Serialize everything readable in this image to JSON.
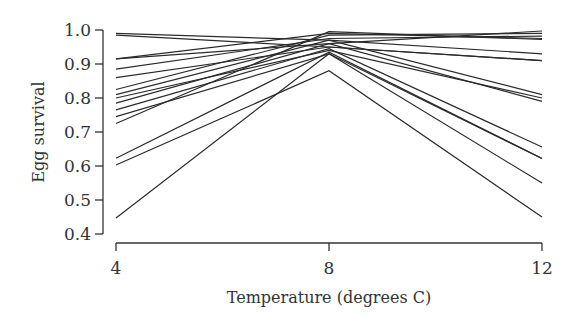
{
  "chart_data": {
    "type": "line",
    "title": "",
    "xlabel": "Temperature (degrees C)",
    "ylabel": "Egg survival",
    "x": [
      4,
      8,
      12
    ],
    "x_ticks": [
      "4",
      "8",
      "12"
    ],
    "y_ticks": [
      "0.4",
      "0.5",
      "0.6",
      "0.7",
      "0.8",
      "0.9",
      "1.0"
    ],
    "xlim": [
      4,
      12
    ],
    "ylim": [
      0.4,
      1.0
    ],
    "grid": false,
    "legend": "none",
    "line_color": "#2b2b2b",
    "series": [
      {
        "name": "family-1",
        "values": [
          0.99,
          0.97,
          0.93
        ]
      },
      {
        "name": "family-2",
        "values": [
          0.985,
          0.95,
          0.91
        ]
      },
      {
        "name": "family-3",
        "values": [
          0.915,
          0.99,
          0.975
        ]
      },
      {
        "name": "family-4",
        "values": [
          0.915,
          0.96,
          0.997
        ]
      },
      {
        "name": "family-5",
        "values": [
          0.885,
          0.975,
          0.982
        ]
      },
      {
        "name": "family-6",
        "values": [
          0.86,
          0.95,
          0.91
        ]
      },
      {
        "name": "family-7",
        "values": [
          0.825,
          0.985,
          0.99
        ]
      },
      {
        "name": "family-8",
        "values": [
          0.81,
          0.97,
          0.81
        ]
      },
      {
        "name": "family-9",
        "values": [
          0.8,
          0.94,
          0.8
        ]
      },
      {
        "name": "family-10",
        "values": [
          0.785,
          0.96,
          0.79
        ]
      },
      {
        "name": "family-11",
        "values": [
          0.765,
          0.945,
          0.656
        ]
      },
      {
        "name": "family-12",
        "values": [
          0.745,
          0.93,
          0.622
        ]
      },
      {
        "name": "family-13",
        "values": [
          0.725,
          0.995,
          0.972
        ]
      },
      {
        "name": "family-14",
        "values": [
          0.623,
          0.935,
          0.622
        ]
      },
      {
        "name": "family-15",
        "values": [
          0.603,
          0.88,
          0.45
        ]
      },
      {
        "name": "family-16",
        "values": [
          0.447,
          0.93,
          0.55
        ]
      }
    ]
  }
}
